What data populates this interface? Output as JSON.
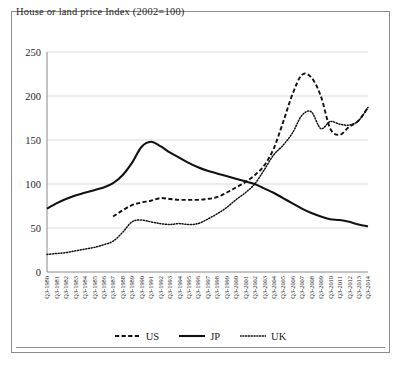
{
  "chart_data": {
    "type": "line",
    "title": "House or land price Index (2002=100)",
    "xlabel": "",
    "ylabel": "",
    "ylim": [
      0,
      250
    ],
    "yticks": [
      0,
      50,
      100,
      150,
      200,
      250
    ],
    "grid": true,
    "legend_position": "bottom",
    "categories": [
      "Q3-1980",
      "Q3-1981",
      "Q3-1982",
      "Q3-1983",
      "Q3-1984",
      "Q3-1985",
      "Q3-1986",
      "Q3-1987",
      "Q3-1988",
      "Q3-1989",
      "Q3-1990",
      "Q3-1991",
      "Q3-1992",
      "Q3-1993",
      "Q3-1994",
      "Q3-1995",
      "Q3-1996",
      "Q3-1997",
      "Q3-1998",
      "Q3-1999",
      "Q3-2000",
      "Q3-2001",
      "Q3-2002",
      "Q3-2003",
      "Q3-2004",
      "Q3-2005",
      "Q3-2006",
      "Q3-2007",
      "Q3-2008",
      "Q3-2009",
      "Q3-2010",
      "Q3-2011",
      "Q3-2012",
      "Q3-2013",
      "Q3-2014"
    ],
    "series": [
      {
        "name": "US",
        "style": "dashed",
        "values": [
          null,
          null,
          null,
          null,
          null,
          null,
          null,
          63,
          70,
          76,
          79,
          81,
          84,
          83,
          82,
          82,
          82,
          83,
          85,
          90,
          96,
          102,
          110,
          121,
          140,
          170,
          202,
          224,
          221,
          200,
          163,
          156,
          165,
          172,
          187
        ]
      },
      {
        "name": "JP",
        "style": "solid",
        "values": [
          72,
          78,
          83,
          87,
          90,
          93,
          96,
          101,
          110,
          124,
          142,
          148,
          143,
          136,
          130,
          124,
          119,
          115,
          112,
          109,
          106,
          103,
          100,
          95,
          90,
          84,
          78,
          72,
          67,
          63,
          60,
          59,
          57,
          54,
          52
        ]
      },
      {
        "name": "UK",
        "style": "dotted",
        "values": [
          20,
          21,
          22,
          24,
          26,
          28,
          31,
          35,
          45,
          57,
          59,
          57,
          55,
          54,
          55,
          54,
          55,
          60,
          66,
          73,
          82,
          90,
          100,
          116,
          133,
          144,
          158,
          178,
          182,
          163,
          171,
          168,
          167,
          172,
          187
        ]
      }
    ]
  },
  "legend": {
    "items": [
      {
        "label": "US",
        "style": "dashed"
      },
      {
        "label": "JP",
        "style": "solid"
      },
      {
        "label": "UK",
        "style": "dotted"
      }
    ]
  }
}
